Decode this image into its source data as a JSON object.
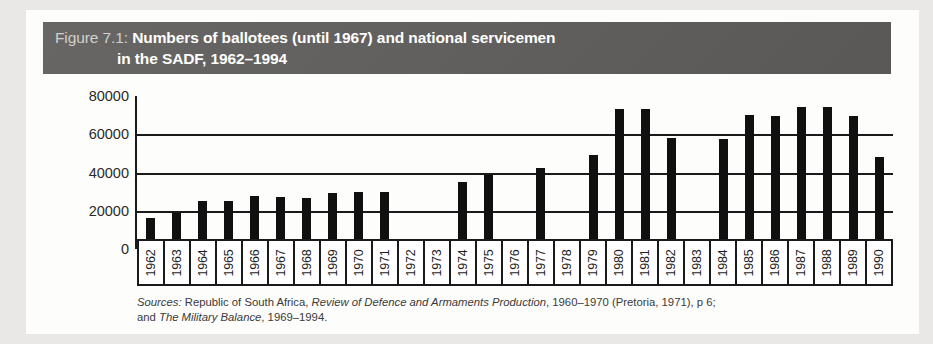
{
  "figure": {
    "number": "Figure 7.1:",
    "title_line1": "Numbers of ballotees (until 1967) and national servicemen",
    "title_line2": "in the SADF, 1962–1994",
    "header_color": "#605e5c",
    "bar_color": "#101010"
  },
  "sources": {
    "label": "Sources:",
    "line1_a": " Republic of South Africa, ",
    "line1_italic": "Review of Defence and Armaments Production",
    "line1_b": ", 1960–1970 (Pretoria, 1971), p 6;",
    "line2_a": "and ",
    "line2_italic": "The Military Balance",
    "line2_b": ", 1969–1994."
  },
  "chart_data": {
    "type": "bar",
    "title": "Numbers of ballotees (until 1967) and national servicemen in the SADF, 1962–1994",
    "xlabel": "",
    "ylabel": "",
    "ylim": [
      0,
      80000
    ],
    "yticks": [
      80000,
      60000,
      40000,
      20000,
      0
    ],
    "ytick_labels": [
      "80000",
      "60000",
      "40000",
      "20000",
      "0"
    ],
    "grid": true,
    "legend": "none",
    "categories": [
      "1962",
      "1963",
      "1964",
      "1965",
      "1966",
      "1967",
      "1968",
      "1969",
      "1970",
      "1971",
      "1972",
      "1973",
      "1974",
      "1975",
      "1976",
      "1977",
      "1978",
      "1979",
      "1980",
      "1981",
      "1982",
      "1983",
      "1984",
      "1985",
      "1986",
      "1987",
      "1988",
      "1989",
      "1990"
    ],
    "values": [
      16000,
      19000,
      25000,
      25000,
      27500,
      27000,
      26500,
      29500,
      30000,
      30000,
      null,
      null,
      35000,
      38500,
      null,
      42500,
      null,
      49000,
      73000,
      73000,
      58000,
      null,
      57500,
      70000,
      69500,
      74500,
      74500,
      69500,
      48000
    ]
  }
}
